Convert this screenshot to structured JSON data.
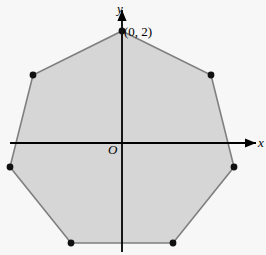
{
  "figure": {
    "kind": "geometry-diagram",
    "width": 266,
    "height": 255,
    "background_color": "#f7f7f7"
  },
  "axes": {
    "x_label": "x",
    "y_label": "y",
    "origin_label": "O",
    "color": "#000000",
    "x_axis": {
      "x1": 10,
      "y1": 143,
      "x2": 256,
      "y2": 143,
      "arrow_end": true,
      "arrow_start": false
    },
    "y_axis": {
      "x1": 122,
      "y1": 252,
      "x2": 122,
      "y2": 10,
      "arrow_end": true,
      "arrow_start": false
    }
  },
  "shape": {
    "name": "heptagon",
    "sides": 7,
    "fill_color": "#d6d6d6",
    "stroke_color": "#7f7f7f",
    "stroke_width": 1.6,
    "vertex_color": "#111111",
    "vertex_radius": 3.4,
    "vertices_px": [
      {
        "x": 122,
        "y": 31
      },
      {
        "x": 211,
        "y": 75
      },
      {
        "x": 234,
        "y": 167
      },
      {
        "x": 173,
        "y": 243
      },
      {
        "x": 71,
        "y": 243
      },
      {
        "x": 10,
        "y": 167
      },
      {
        "x": 33,
        "y": 75
      }
    ]
  },
  "annotations": [
    {
      "id": "vertex-top",
      "text": "(0, 2)",
      "x": 124,
      "y": 25
    }
  ],
  "chart_data": {
    "type": "scatter",
    "title": "",
    "xlabel": "x",
    "ylabel": "y",
    "grid": false,
    "legend": null,
    "annotations": [
      "(0, 2)",
      "O"
    ],
    "series": [
      {
        "name": "heptagon vertices",
        "points": [
          {
            "x": 0.0,
            "y": 2.0
          },
          {
            "x": 1.56,
            "y": 1.25
          },
          {
            "x": 1.95,
            "y": -0.45
          },
          {
            "x": 0.87,
            "y": -1.8
          },
          {
            "x": -0.87,
            "y": -1.8
          },
          {
            "x": -1.95,
            "y": -0.45
          },
          {
            "x": -1.56,
            "y": 1.25
          }
        ]
      }
    ]
  }
}
